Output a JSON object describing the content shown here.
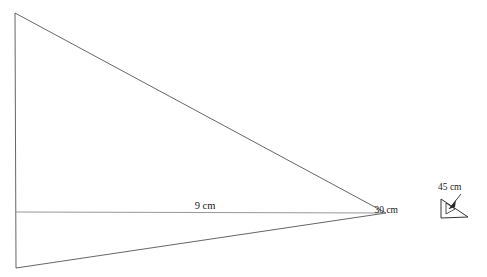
{
  "figure": {
    "background_color": "#ffffff",
    "stroke_color": "#4a4a4a",
    "base_stroke_color": "#8c8c8c",
    "inset_stroke_color": "#333333",
    "label_color": "#1a1a1a"
  },
  "main_triangle": {
    "name": "main-triangle",
    "vertices": {
      "top_left": {
        "x": 15,
        "y": 13
      },
      "bottom_left": {
        "x": 16,
        "y": 268
      },
      "right_apex": {
        "x": 386,
        "y": 213
      }
    },
    "path": "M 15 13 L 386 213 L 16 268 Z"
  },
  "base_line": {
    "name": "base-line-9cm",
    "from": {
      "x": 15,
      "y": 212
    },
    "to": {
      "x": 386,
      "y": 213
    },
    "label": "9 cm",
    "label_x": 205,
    "label_y": 209
  },
  "inset": {
    "name": "angle-detail-inset",
    "triangle_path": "M 441 199 L 441 218 L 468 217 Z",
    "left_side_label": "30 cm",
    "left_side_label_x": 398,
    "left_side_label_y": 213,
    "hypotenuse_label": "45 cm",
    "hypotenuse_label_x": 438,
    "hypotenuse_label_y": 190,
    "leader_from": {
      "x": 461,
      "y": 194
    },
    "leader_to": {
      "x": 449,
      "y": 209
    },
    "arrowhead_points": "449,209 456,200 455,207",
    "angle_arc_path": "M 446 203 L 446 214 L 455 209 Z"
  },
  "labels": [
    {
      "id": "base-length",
      "text": "9 cm"
    },
    {
      "id": "inset-side-a",
      "text": "30 cm"
    },
    {
      "id": "inset-side-b",
      "text": "45 cm"
    }
  ]
}
